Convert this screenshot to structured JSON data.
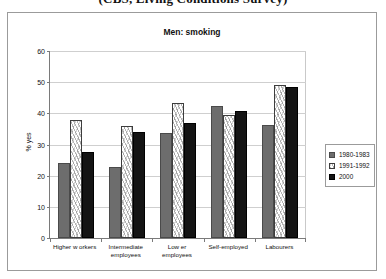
{
  "caption": "(CBS, Living Conditions Survey)",
  "chart_data": {
    "type": "bar",
    "title": "Men: smoking",
    "xlabel": "",
    "ylabel": "% yes",
    "ylim": [
      0,
      60
    ],
    "yticks": [
      0,
      10,
      20,
      30,
      40,
      50,
      60
    ],
    "grid": true,
    "legend_position": "right",
    "categories": [
      "Higher w orkers",
      "Intermediate employees",
      "Low er employees",
      "Self-employed",
      "Labourers"
    ],
    "category_lines": [
      [
        "Higher w orkers"
      ],
      [
        "Intermediate",
        "employees"
      ],
      [
        "Low er employees"
      ],
      [
        "Self-employed"
      ],
      [
        "Labourers"
      ]
    ],
    "series": [
      {
        "name": "1980-1983",
        "color": "#6d6d6d",
        "values": [
          24.0,
          22.8,
          33.7,
          42.5,
          36.4
        ]
      },
      {
        "name": "1991-1992",
        "color": "#ffffff",
        "values": [
          37.8,
          36.0,
          43.3,
          39.5,
          49.0
        ]
      },
      {
        "name": "2000",
        "color": "#141414",
        "values": [
          27.7,
          34.0,
          36.8,
          40.7,
          48.3
        ]
      }
    ]
  }
}
